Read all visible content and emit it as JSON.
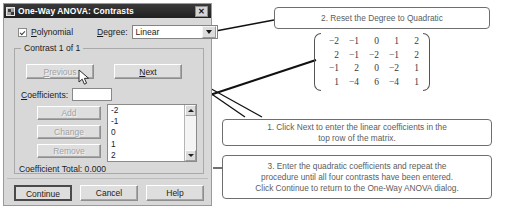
{
  "dialog": {
    "title": "One-Way ANOVA: Contrasts",
    "title_icon": "anova-app-icon",
    "close_label": "✕",
    "polynomial": {
      "label": "Polynomial",
      "accel": "P",
      "checked": true
    },
    "degree": {
      "label": "Degree:",
      "accel": "D",
      "value": "Linear",
      "options": [
        "Linear",
        "Quadratic",
        "Cubic",
        "4th",
        "5th"
      ]
    },
    "group": {
      "title": "Contrast 1 of 1",
      "previous_label": "Previous",
      "previous_accel": "P",
      "previous_enabled": false,
      "next_label": "Next",
      "next_accel": "N",
      "next_enabled": true,
      "coefficients_label": "Coefficients:",
      "coefficients_value": "",
      "add_label": "Add",
      "add_enabled": false,
      "change_label": "Change",
      "change_enabled": false,
      "remove_label": "Remove",
      "remove_enabled": false,
      "coefficient_list": [
        "-2",
        "-1",
        "0",
        "1",
        "2"
      ],
      "coefficient_total_label": "Coefficient Total:",
      "coefficient_total_value": "0.000"
    },
    "buttons": {
      "continue_label": "Continue",
      "cancel_label": "Cancel",
      "help_label": "Help"
    }
  },
  "annotations": {
    "callout_2": "2. Reset the Degree to Quadratic",
    "callout_1": "1. Click Next to enter the linear coefficients in the\ntop row of the matrix.",
    "callout_3": "3. Enter the quadratic coefficients and repeat the\nprocedure until all four contrasts have been entered.\nClick Continue to return to the One-Way ANOVA dialog."
  },
  "matrix": {
    "rows": [
      [
        "-2",
        "-1",
        "0",
        "1",
        "2"
      ],
      [
        "2",
        "-1",
        "-2",
        "-1",
        "2"
      ],
      [
        "-1",
        "2",
        "0",
        "-2",
        "1"
      ],
      [
        "1",
        "-4",
        "6",
        "-4",
        "1"
      ]
    ]
  },
  "colors": {
    "titlebar": "#1f1f1f",
    "dialog_face": "#d8d8d8",
    "callout_text": "#5d5d5d",
    "arrow": "#111111"
  }
}
